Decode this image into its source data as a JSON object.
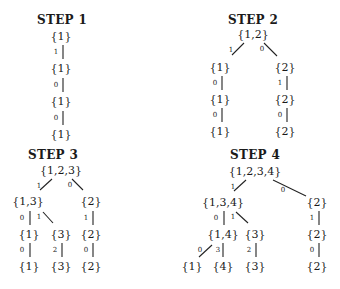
{
  "steps": [
    {
      "title": "STEP 1",
      "title_pos": [
        62,
        20
      ],
      "nodes": [
        {
          "label": "{1}",
          "pos": [
            61,
            36
          ]
        },
        {
          "label": "{1}",
          "pos": [
            61,
            68
          ]
        },
        {
          "label": "{1}",
          "pos": [
            61,
            101
          ]
        },
        {
          "label": "{1}",
          "pos": [
            61,
            134
          ]
        }
      ],
      "edges": [
        {
          "label": "1",
          "label_pos": [
            56,
            52
          ],
          "from": [
            63,
            45
          ],
          "to": [
            63,
            59
          ]
        },
        {
          "label": "0",
          "label_pos": [
            56,
            85
          ],
          "from": [
            63,
            78
          ],
          "to": [
            63,
            92
          ]
        },
        {
          "label": "0",
          "label_pos": [
            56,
            118
          ],
          "from": [
            63,
            111
          ],
          "to": [
            63,
            125
          ]
        }
      ]
    },
    {
      "title": "STEP 2",
      "title_pos": [
        253,
        20
      ],
      "nodes": [
        {
          "label": "{1,2}",
          "pos": [
            253,
            34
          ]
        },
        {
          "label": "{1}",
          "pos": [
            220,
            67
          ]
        },
        {
          "label": "{1}",
          "pos": [
            220,
            99
          ]
        },
        {
          "label": "{1}",
          "pos": [
            220,
            131
          ]
        },
        {
          "label": "{2}",
          "pos": [
            285,
            67
          ]
        },
        {
          "label": "{2}",
          "pos": [
            285,
            99
          ]
        },
        {
          "label": "{2}",
          "pos": [
            285,
            131
          ]
        }
      ],
      "edges": [
        {
          "label": "1",
          "label_pos": [
            231,
            50
          ],
          "from": [
            232,
            55
          ],
          "to": [
            244,
            43
          ]
        },
        {
          "label": "0",
          "label_pos": [
            262,
            49
          ],
          "from": [
            264,
            43
          ],
          "to": [
            277,
            56
          ]
        },
        {
          "label": "0",
          "label_pos": [
            215,
            83
          ],
          "from": [
            222,
            76
          ],
          "to": [
            222,
            90
          ]
        },
        {
          "label": "1",
          "label_pos": [
            280,
            83
          ],
          "from": [
            287,
            76
          ],
          "to": [
            287,
            90
          ]
        },
        {
          "label": "0",
          "label_pos": [
            215,
            115
          ],
          "from": [
            222,
            108
          ],
          "to": [
            222,
            122
          ]
        },
        {
          "label": "0",
          "label_pos": [
            280,
            115
          ],
          "from": [
            287,
            108
          ],
          "to": [
            287,
            122
          ]
        }
      ]
    },
    {
      "title": "STEP 3",
      "title_pos": [
        53,
        155
      ],
      "nodes": [
        {
          "label": "{1,2,3}",
          "pos": [
            61,
            170
          ]
        },
        {
          "label": "{1,3}",
          "pos": [
            28,
            201
          ]
        },
        {
          "label": "{2}",
          "pos": [
            91,
            201
          ]
        },
        {
          "label": "{1}",
          "pos": [
            29,
            234
          ]
        },
        {
          "label": "{3}",
          "pos": [
            61,
            234
          ]
        },
        {
          "label": "{2}",
          "pos": [
            91,
            234
          ]
        },
        {
          "label": "{1}",
          "pos": [
            29,
            266
          ]
        },
        {
          "label": "{3}",
          "pos": [
            61,
            266
          ]
        },
        {
          "label": "{2}",
          "pos": [
            91,
            266
          ]
        }
      ],
      "edges": [
        {
          "label": "1",
          "label_pos": [
            39,
            186
          ],
          "from": [
            40,
            190
          ],
          "to": [
            52,
            179
          ]
        },
        {
          "label": "0",
          "label_pos": [
            70,
            185
          ],
          "from": [
            72,
            179
          ],
          "to": [
            83,
            190
          ]
        },
        {
          "label": "0",
          "label_pos": [
            22,
            218
          ],
          "from": [
            30,
            211
          ],
          "to": [
            30,
            225
          ]
        },
        {
          "label": "1",
          "label_pos": [
            39,
            217
          ],
          "from": [
            43,
            212
          ],
          "to": [
            53,
            223
          ]
        },
        {
          "label": "1",
          "label_pos": [
            86,
            218
          ],
          "from": [
            93,
            211
          ],
          "to": [
            93,
            225
          ]
        },
        {
          "label": "0",
          "label_pos": [
            22,
            250
          ],
          "from": [
            30,
            243
          ],
          "to": [
            30,
            257
          ]
        },
        {
          "label": "2",
          "label_pos": [
            55,
            250
          ],
          "from": [
            62,
            243
          ],
          "to": [
            62,
            257
          ]
        },
        {
          "label": "0",
          "label_pos": [
            86,
            250
          ],
          "from": [
            93,
            243
          ],
          "to": [
            93,
            257
          ]
        }
      ]
    },
    {
      "title": "STEP 4",
      "title_pos": [
        255,
        155
      ],
      "nodes": [
        {
          "label": "{1,2,3,4}",
          "pos": [
            255,
            171
          ]
        },
        {
          "label": "{1,3,4}",
          "pos": [
            223,
            202
          ]
        },
        {
          "label": "{2}",
          "pos": [
            317,
            202
          ]
        },
        {
          "label": "{1,4}",
          "pos": [
            223,
            234
          ]
        },
        {
          "label": "{3}",
          "pos": [
            255,
            234
          ]
        },
        {
          "label": "{2}",
          "pos": [
            317,
            234
          ]
        },
        {
          "label": "{1}",
          "pos": [
            192,
            266
          ]
        },
        {
          "label": "{4}",
          "pos": [
            223,
            266
          ]
        },
        {
          "label": "{3}",
          "pos": [
            255,
            266
          ]
        },
        {
          "label": "{2}",
          "pos": [
            317,
            266
          ]
        }
      ],
      "edges": [
        {
          "label": "1",
          "label_pos": [
            233,
            187
          ],
          "from": [
            234,
            191
          ],
          "to": [
            246,
            180
          ]
        },
        {
          "label": "0",
          "label_pos": [
            283,
            190
          ],
          "from": [
            273,
            180
          ],
          "to": [
            306,
            196
          ]
        },
        {
          "label": "0",
          "label_pos": [
            216,
            218
          ],
          "from": [
            224,
            211
          ],
          "to": [
            224,
            225
          ]
        },
        {
          "label": "1",
          "label_pos": [
            233,
            217
          ],
          "from": [
            236,
            212
          ],
          "to": [
            248,
            223
          ]
        },
        {
          "label": "1",
          "label_pos": [
            312,
            218
          ],
          "from": [
            319,
            211
          ],
          "to": [
            319,
            225
          ]
        },
        {
          "label": "0",
          "label_pos": [
            200,
            250
          ],
          "from": [
            199,
            257
          ],
          "to": [
            212,
            245
          ]
        },
        {
          "label": "3",
          "label_pos": [
            218,
            250
          ],
          "from": [
            223,
            243
          ],
          "to": [
            223,
            257
          ]
        },
        {
          "label": "2",
          "label_pos": [
            249,
            250
          ],
          "from": [
            256,
            243
          ],
          "to": [
            256,
            257
          ]
        },
        {
          "label": "0",
          "label_pos": [
            312,
            250
          ],
          "from": [
            319,
            243
          ],
          "to": [
            319,
            257
          ]
        }
      ]
    }
  ]
}
